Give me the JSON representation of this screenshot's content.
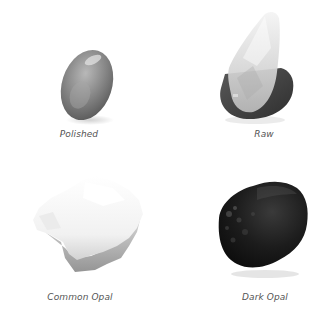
{
  "figure": {
    "background": "#ffffff",
    "items": [
      {
        "label": "Polished",
        "stone": "polished-opal-cabochon",
        "tone": "mid-gray"
      },
      {
        "label": "Raw",
        "stone": "raw-opal-crystal",
        "tone": "translucent-over-dark"
      },
      {
        "label": "Common Opal",
        "stone": "common-opal-chunk",
        "tone": "white"
      },
      {
        "label": "Dark Opal",
        "stone": "dark-opal-tumbled",
        "tone": "black"
      }
    ]
  }
}
